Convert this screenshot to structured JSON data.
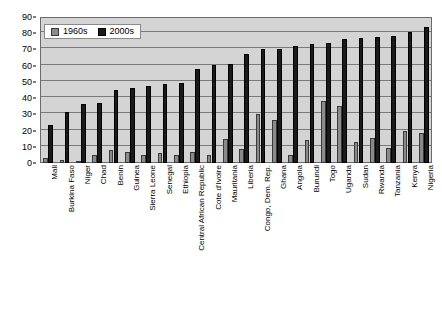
{
  "chart_data": {
    "type": "bar",
    "title": "",
    "xlabel": "",
    "ylabel": "",
    "ylim": [
      0,
      90
    ],
    "ytick_step": 10,
    "yticks": [
      0,
      10,
      20,
      30,
      40,
      50,
      60,
      70,
      80,
      90
    ],
    "grid": true,
    "legend_position": "top-left",
    "orientation": "vertical",
    "categories": [
      "Mali",
      "Burkina Faso",
      "Niger",
      "Chad",
      "Benin",
      "Guinea",
      "Sierra Leone",
      "Senegal",
      "Ethiopia",
      "Central African Republic",
      "Cote d'Ivoire",
      "Mauritania",
      "Liberia",
      "Congo, Dem. Rep.",
      "Ghana",
      "Angola",
      "Burundi",
      "Togo",
      "Uganda",
      "Sudan",
      "Rwanda",
      "Tanzania",
      "Kenya",
      "Nigeria"
    ],
    "series": [
      {
        "name": "1960s",
        "color": "#8a8a8a",
        "values": [
          3,
          2,
          1,
          5,
          8,
          6.5,
          5,
          6,
          5,
          6.5,
          5,
          14.5,
          8.5,
          30.5,
          26.5,
          5,
          14,
          38.5,
          35,
          13,
          15.5,
          9.5,
          20,
          18.5
        ]
      },
      {
        "name": "2000s",
        "color": "#1a1a1a",
        "values": [
          23.5,
          31.5,
          36.5,
          37,
          45,
          46.5,
          47.5,
          48.5,
          49.5,
          58,
          60.5,
          61,
          67.5,
          70.5,
          70.5,
          72,
          73.5,
          74,
          76.5,
          77,
          77.5,
          78,
          80.5,
          84
        ]
      }
    ]
  },
  "legend": {
    "entries": [
      {
        "label": "1960s"
      },
      {
        "label": "2000s"
      }
    ]
  }
}
